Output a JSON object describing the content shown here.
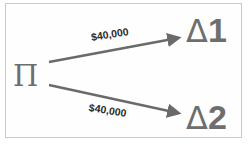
{
  "diagram": {
    "source_node": {
      "label": "Π"
    },
    "target_nodes": [
      {
        "symbol": "Δ",
        "index": "1"
      },
      {
        "symbol": "Δ",
        "index": "2"
      }
    ],
    "edges": [
      {
        "from": "Π",
        "to": "Δ1",
        "label": "$40,000"
      },
      {
        "from": "Π",
        "to": "Δ2",
        "label": "$40,000"
      }
    ],
    "colors": {
      "node_text": "#6e6e6e",
      "arrow": "#6a6a6a",
      "label_text": "#2a2a2a",
      "frame_border": "#c8c8c8",
      "background": "#ffffff"
    }
  }
}
